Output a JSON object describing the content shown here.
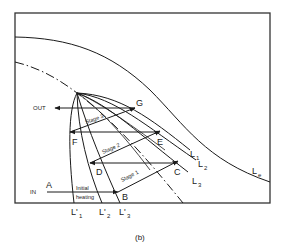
{
  "figure": {
    "caption": "(b)",
    "points": {
      "A": "A",
      "B": "B",
      "C": "C",
      "D": "D",
      "E": "E",
      "F": "F",
      "G": "G"
    },
    "flow": {
      "in": "IN",
      "out": "OUT"
    },
    "steps": {
      "initial": [
        "Initial",
        "heating"
      ],
      "stage1": "Stage 1",
      "stage2": "Stage 2",
      "stage3": "Stage 3"
    },
    "curves": {
      "L1": {
        "base": "L",
        "sub": "1"
      },
      "L2": {
        "base": "L",
        "sub": "2"
      },
      "L3": {
        "base": "L",
        "sub": "3"
      },
      "Le": {
        "base": "L",
        "sub": "e"
      },
      "L1p": {
        "base": "L'",
        "sub": "1"
      },
      "L2p": {
        "base": "L'",
        "sub": "2"
      },
      "L3p": {
        "base": "L'",
        "sub": "3"
      }
    }
  }
}
